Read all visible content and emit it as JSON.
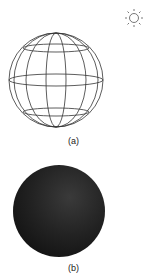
{
  "figure": {
    "panels": [
      {
        "id": "a",
        "label": "(a)",
        "description": "wireframe sphere with latitude and longitude lines",
        "stroke": "#333333"
      },
      {
        "id": "b",
        "label": "(b)",
        "description": "dark shaded sphere",
        "fill": "#1e1e1e"
      }
    ],
    "light_source": {
      "icon": "sun-icon",
      "stroke": "#555555"
    }
  }
}
